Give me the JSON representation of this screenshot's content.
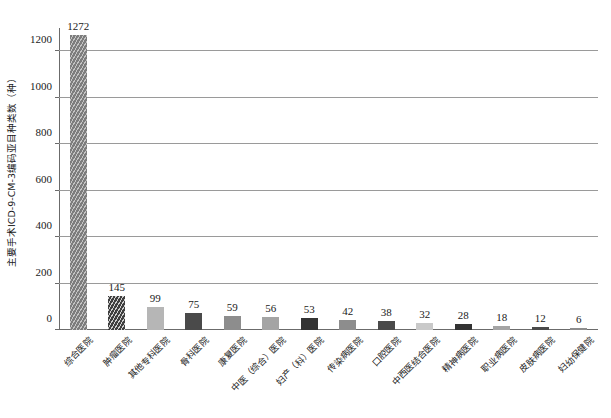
{
  "chart_data": {
    "type": "bar",
    "title": "",
    "subtitle": "",
    "xlabel": "",
    "ylabel": "主要手术ICD-9-CM-3编码亚目种类数（种）",
    "ylim": [
      0,
      1300
    ],
    "ytick_values": [
      0,
      200,
      400,
      600,
      800,
      1000,
      1200
    ],
    "ytick_labels": [
      "0",
      "200",
      "400",
      "600",
      "800",
      "1000",
      "1200"
    ],
    "grid": "horizontal",
    "legend": "none",
    "categories": [
      "综合医院",
      "肿瘤医院",
      "其他专科医院",
      "骨科医院",
      "康复医院",
      "中医（综合）医院",
      "妇产（科）医院",
      "传染病医院",
      "口腔医院",
      "中西医结合医院",
      "精神病医院",
      "职业病医院",
      "皮肤病医院",
      "妇幼保健院"
    ],
    "values": [
      1272,
      145,
      99,
      75,
      59,
      56,
      53,
      42,
      38,
      32,
      28,
      18,
      12,
      6
    ],
    "value_labels": [
      "1272",
      "145",
      "99",
      "75",
      "59",
      "56",
      "53",
      "42",
      "38",
      "32",
      "28",
      "18",
      "12",
      "6"
    ],
    "bar_styles": [
      "fill-hatch-mid",
      "fill-hatch-dark",
      "fill-light",
      "fill-dark-solid",
      "fill-mid-solid",
      "fill-midlight",
      "fill-darkest",
      "fill-mid-solid",
      "fill-dark-solid",
      "fill-verylight",
      "fill-darkest",
      "fill-midlight",
      "fill-dark-solid",
      "fill-mid-solid"
    ],
    "colors": {
      "axis": "#6b6b6b",
      "gridline": "#9a9a9a",
      "text": "#1a1a1a",
      "background": "#ffffff"
    }
  }
}
